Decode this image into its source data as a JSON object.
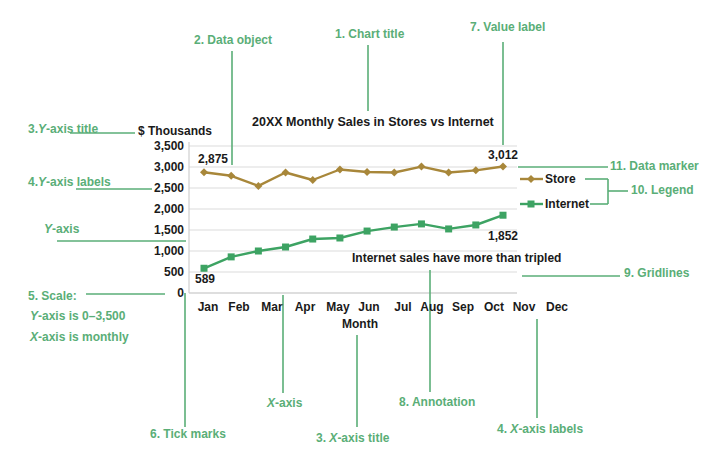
{
  "colors": {
    "callout": "#5aae77",
    "store": "#a8873a",
    "internet": "#3da363",
    "grid": "#dcdcdc",
    "text": "#1a1a1a"
  },
  "callouts": {
    "data_object": "2. Data object",
    "chart_title": "1. Chart title",
    "value_label": "7. Value label",
    "y_axis_title_num": "3.",
    "y_axis_title_y": "Y",
    "y_axis_title_rest": "-axis  title",
    "y_axis_labels_num": "4.",
    "y_axis_labels_y": "Y",
    "y_axis_labels_rest": "-axis labels",
    "y_axis_y": "Y",
    "y_axis_rest": "-axis",
    "scale_title": "5. Scale:",
    "scale_y_y": "Y",
    "scale_y_rest": "-axis is 0–3,500",
    "scale_x_x": "X",
    "scale_x_rest": "-axis is monthly",
    "x_axis_x": "X",
    "x_axis_rest": "-axis",
    "tick_marks": "6. Tick marks",
    "x_axis_title_num": "3.",
    "x_axis_title_x": "X",
    "x_axis_title_rest": "-axis title",
    "annotation": "8. Annotation",
    "x_axis_labels_num": "4.",
    "x_axis_labels_x": "X",
    "x_axis_labels_rest": "-axis labels",
    "data_marker": "11. Data marker",
    "legend": "10. Legend",
    "gridlines": "9. Gridlines"
  },
  "chart_data": {
    "type": "line",
    "title": "20XX Monthly Sales in Stores vs Internet",
    "xlabel": "Month",
    "ylabel": "$ Thousands",
    "ylim": [
      0,
      3500
    ],
    "y_ticks": [
      "3,500",
      "3,000",
      "2,500",
      "2,000",
      "1,500",
      "1,000",
      "500",
      "0"
    ],
    "categories": [
      "Jan",
      "Feb",
      "Mar",
      "Apr",
      "May",
      "Jun",
      "Jul",
      "Aug",
      "Sep",
      "Oct",
      "Nov",
      "Dec"
    ],
    "series": [
      {
        "name": "Store",
        "values": [
          2875,
          2790,
          2550,
          2870,
          2690,
          2940,
          2880,
          2870,
          3010,
          2870,
          2920,
          3012
        ]
      },
      {
        "name": "Internet",
        "values": [
          589,
          860,
          1000,
          1095,
          1285,
          1310,
          1475,
          1570,
          1645,
          1525,
          1620,
          1852
        ]
      }
    ],
    "value_labels": {
      "store_first": "2,875",
      "store_last": "3,012",
      "internet_first": "589",
      "internet_last": "1,852"
    },
    "annotation": "Internet sales have more than tripled",
    "legend": [
      "Store",
      "Internet"
    ],
    "legend_position": "right",
    "grid": true
  }
}
